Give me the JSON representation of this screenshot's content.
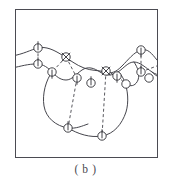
{
  "figure": {
    "caption": "( b )",
    "frame": {
      "x": 15,
      "y": 9,
      "width": 143,
      "height": 149,
      "stroke": "#4b4b52",
      "stroke_width": 1.4,
      "fill": "#ffffff"
    },
    "style": {
      "contour_stroke": "#45454c",
      "contour_width": 1.0,
      "dashed_stroke": "#45454c",
      "dashed_width": 0.9,
      "dash_pattern": "3,2.4",
      "node_stroke": "#2e2e33",
      "node_width": 0.9,
      "node_fill": "#ffffff",
      "node_radius": 4.2,
      "tick_stroke": "#2e2e33"
    },
    "contours": [
      {
        "name": "upper-contour",
        "path": "M -4 46 C 8 44, 14 40, 22 38 C 30 36, 38 40, 46 45 C 54 50, 60 55, 68 58 C 76 61, 82 60, 89 62 C 96 64, 100 62, 106 56 C 112 50, 118 42, 125 40 C 132 38, 136 44, 141 50 C 146 56, 150 58, 155 57"
      },
      {
        "name": "middle-contour",
        "path": "M -4 58 C 6 56, 12 54, 20 54 C 28 54, 32 58, 36 62 C 40 66, 44 70, 50 70 C 56 70, 60 64, 66 60 C 72 56, 78 58, 84 62 C 90 66, 96 66, 102 62 C 108 58, 112 52, 118 52 C 124 52, 130 58, 136 62 C 142 66, 148 66, 155 64"
      },
      {
        "name": "lower-left-lobe",
        "path": "M 36 62 C 30 70, 26 84, 28 96 C 30 108, 40 116, 52 118 C 60 119, 66 116, 72 114"
      },
      {
        "name": "lower-basin",
        "path": "M 52 118 C 62 124, 74 128, 86 126 C 98 124, 106 114, 110 102 C 113 92, 112 80, 108 70 C 106 66, 104 63, 102 62"
      },
      {
        "name": "right-small-lobe",
        "path": "M 118 52 C 122 58, 124 64, 122 70 C 120 75, 116 77, 112 75"
      },
      {
        "name": "right-edge-curve",
        "path": "M 136 62 C 140 66, 146 70, 152 69 C 155 68, 157 67, 159 66"
      }
    ],
    "dashed_links": [
      {
        "name": "link-a",
        "x1": 22,
        "y1": 38,
        "x2": 22,
        "y2": 54
      },
      {
        "name": "link-b",
        "x1": 50,
        "y1": 47,
        "x2": 36,
        "y2": 62
      },
      {
        "name": "link-c",
        "x1": 50,
        "y1": 47,
        "x2": 61,
        "y2": 68
      },
      {
        "name": "link-d",
        "x1": 61,
        "y1": 68,
        "x2": 52,
        "y2": 118
      },
      {
        "name": "link-e",
        "x1": 90,
        "y1": 61,
        "x2": 86,
        "y2": 126
      },
      {
        "name": "link-f",
        "x1": 90,
        "y1": 61,
        "x2": 101,
        "y2": 66
      },
      {
        "name": "link-g",
        "x1": 125,
        "y1": 40,
        "x2": 125,
        "y2": 62
      },
      {
        "name": "link-h",
        "x1": 125,
        "y1": 62,
        "x2": 146,
        "y2": 54
      },
      {
        "name": "link-i",
        "x1": 101,
        "y1": 66,
        "x2": 110,
        "y2": 74
      }
    ],
    "nodes": [
      {
        "name": "node-1",
        "x": 22,
        "y": 38,
        "tick": "up"
      },
      {
        "name": "node-2",
        "x": 22,
        "y": 54,
        "tick": "up"
      },
      {
        "name": "node-3",
        "x": 36,
        "y": 62,
        "tick": "down"
      },
      {
        "name": "node-4",
        "x": 50,
        "y": 47,
        "tick": "cross"
      },
      {
        "name": "node-5",
        "x": 61,
        "y": 68,
        "tick": "down"
      },
      {
        "name": "node-6",
        "x": 75,
        "y": 73,
        "tick": "up"
      },
      {
        "name": "node-7",
        "x": 90,
        "y": 61,
        "tick": "cross"
      },
      {
        "name": "node-8",
        "x": 101,
        "y": 66,
        "tick": "down"
      },
      {
        "name": "node-9",
        "x": 110,
        "y": 74,
        "tick": "none"
      },
      {
        "name": "node-10",
        "x": 125,
        "y": 40,
        "tick": "down"
      },
      {
        "name": "node-11",
        "x": 125,
        "y": 62,
        "tick": "up"
      },
      {
        "name": "node-12",
        "x": 133,
        "y": 68,
        "tick": "none"
      },
      {
        "name": "node-13",
        "x": 146,
        "y": 54,
        "tick": "none"
      },
      {
        "name": "node-14",
        "x": 52,
        "y": 118,
        "tick": "up"
      },
      {
        "name": "node-15",
        "x": 86,
        "y": 126,
        "tick": "up"
      }
    ]
  }
}
